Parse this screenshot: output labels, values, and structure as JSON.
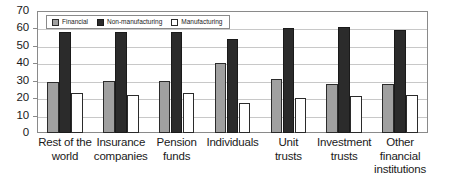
{
  "chart_data": {
    "type": "bar",
    "title": "",
    "subtitle": "",
    "xlabel": "",
    "ylabel": "",
    "ylim": [
      0,
      70
    ],
    "ytick_interval": 10,
    "yticks": [
      0,
      10,
      20,
      30,
      40,
      50,
      60,
      70
    ],
    "ytick_labels": [
      "0",
      "10",
      "20",
      "30",
      "40",
      "50",
      "60",
      "70"
    ],
    "grid": true,
    "grid_axis": "y",
    "legend": true,
    "legend_position": "top-left-inside",
    "categories": [
      "Rest of the world",
      "Insurance companies",
      "Pension funds",
      "Individuals",
      "Unit trusts",
      "Investment trusts",
      "Other financial institutions"
    ],
    "category_lines": [
      [
        "Rest of the",
        "world"
      ],
      [
        "Insurance",
        "companies"
      ],
      [
        "Pension",
        "funds"
      ],
      [
        "Individuals"
      ],
      [
        "Unit",
        "trusts"
      ],
      [
        "Investment",
        "trusts"
      ],
      [
        "Other",
        "financial",
        "institutions"
      ]
    ],
    "series": [
      {
        "name": "Financial",
        "color": "#a0a0a0",
        "values": [
          29,
          30,
          30,
          40,
          31,
          28,
          28
        ]
      },
      {
        "name": "Non-manufacturing",
        "color": "#2b2b2b",
        "values": [
          58,
          58,
          58,
          54,
          60,
          61,
          59
        ]
      },
      {
        "name": "Manufacturing",
        "color": "#ffffff",
        "values": [
          23,
          22,
          23,
          17,
          20,
          21,
          22
        ]
      }
    ],
    "annotations": []
  },
  "style": {
    "axis_color": "#8a8a8a",
    "grid_color": "#c8c8c8",
    "text_color": "#1a1a1a",
    "background": "#ffffff",
    "bar_outline": "#2b2b2b"
  }
}
